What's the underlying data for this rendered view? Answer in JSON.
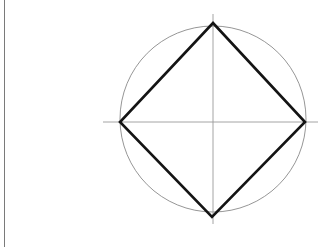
{
  "page": {
    "width": 328,
    "height": 247,
    "background_color": "#ffffff"
  },
  "margin_rule": {
    "name": "page-margin-line",
    "x": 4,
    "y_start": 0,
    "y_end": 247,
    "color": "#7a7a7a",
    "width": 1
  },
  "figure": {
    "center": {
      "x": 213,
      "y": 120
    },
    "circle": {
      "label": "circumscribed-circle",
      "cx": 213,
      "cy": 119,
      "r": 93,
      "stroke_color": "#8a8a8a",
      "stroke_width": 0.9,
      "fill": "none"
    },
    "square": {
      "label": "inscribed-square",
      "rotation_deg": 45,
      "stroke_color": "#141414",
      "stroke_width": 2.6,
      "fill": "none",
      "vertices": [
        {
          "name": "top-vertex",
          "x": 213,
          "y": 23
        },
        {
          "name": "right-vertex",
          "x": 305,
          "y": 122
        },
        {
          "name": "bottom-vertex",
          "x": 212,
          "y": 217
        },
        {
          "name": "left-vertex",
          "x": 120,
          "y": 122
        }
      ]
    },
    "axes": {
      "stroke_color": "#9a9a9a",
      "stroke_width": 0.9,
      "horizontal": {
        "label": "horizontal-axis",
        "x1": 103,
        "y1": 122,
        "x2": 318,
        "y2": 122
      },
      "vertical": {
        "label": "vertical-axis",
        "x1": 213,
        "y1": 14,
        "x2": 213,
        "y2": 224
      }
    }
  },
  "chart_data": {
    "type": "diagram",
    "title": "",
    "shapes": [
      {
        "kind": "circle",
        "center": [
          213,
          119
        ],
        "radius": 93,
        "stroke": "#8a8a8a",
        "stroke_width": 0.9
      },
      {
        "kind": "polygon",
        "name": "square-inscribed-in-circle",
        "points": [
          [
            213,
            23
          ],
          [
            305,
            122
          ],
          [
            212,
            217
          ],
          [
            120,
            122
          ]
        ],
        "stroke": "#141414",
        "stroke_width": 2.6
      },
      {
        "kind": "line",
        "name": "horizontal-diameter",
        "points": [
          [
            103,
            122
          ],
          [
            318,
            122
          ]
        ],
        "stroke": "#9a9a9a",
        "stroke_width": 0.9
      },
      {
        "kind": "line",
        "name": "vertical-diameter",
        "points": [
          [
            213,
            14
          ],
          [
            213,
            224
          ]
        ],
        "stroke": "#9a9a9a",
        "stroke_width": 0.9
      },
      {
        "kind": "line",
        "name": "page-margin-rule",
        "points": [
          [
            4,
            0
          ],
          [
            4,
            247
          ]
        ],
        "stroke": "#7a7a7a",
        "stroke_width": 1
      }
    ],
    "annotations": [],
    "legend": []
  }
}
